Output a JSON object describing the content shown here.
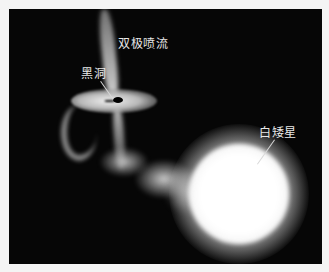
{
  "figure": {
    "labels": {
      "jet": "双极喷流",
      "black_hole": "黑洞",
      "white_dwarf": "白矮星"
    },
    "colors": {
      "background": "#060606",
      "glow": "#ffffff",
      "label": "#e8e8e8"
    }
  }
}
